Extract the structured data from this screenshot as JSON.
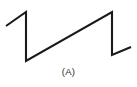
{
  "figure": {
    "caption": "(A)",
    "background_color": "#ffffff",
    "stroke_color": "#1a1a1a",
    "stroke_width": 2.1
  },
  "chart_data": {
    "type": "line",
    "title": "",
    "subtitle": "",
    "xlabel": "",
    "ylabel": "",
    "annotations": [
      "(A)"
    ],
    "legend": [],
    "legend_position": "none",
    "grid": false,
    "axes_visible": false,
    "tick_labels_x": [],
    "tick_labels_y": [],
    "xlim": [
      0,
      137
    ],
    "ylim": [
      0,
      87
    ],
    "waveform": "sawtooth",
    "period_px": 86,
    "amplitude_px": 49,
    "peak_y_px": 12,
    "trough_y_px": 61,
    "series": [
      {
        "name": "sawtooth",
        "points": [
          [
            6,
            26
          ],
          [
            26,
            12
          ],
          [
            26,
            61
          ],
          [
            112,
            12
          ],
          [
            112,
            55
          ],
          [
            131,
            47
          ]
        ]
      }
    ],
    "path_d": "M 6 26 L 26 12 L 26 61 L 112 12 L 112 55 L 131 47"
  }
}
